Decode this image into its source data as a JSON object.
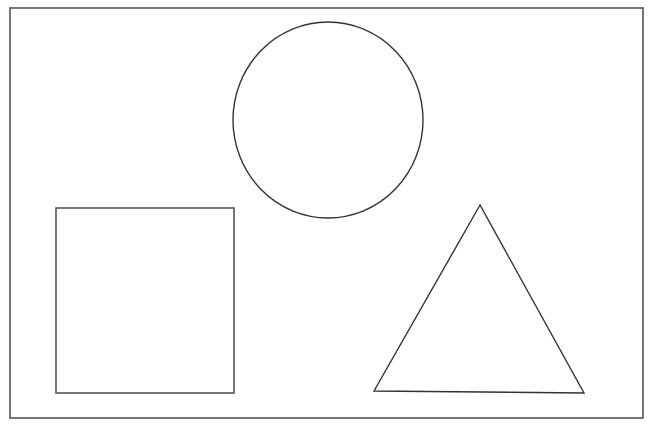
{
  "diagram": {
    "background": "#ffffff",
    "stroke_color": "#333333",
    "frame": {
      "x": 10,
      "y": 8,
      "width": 633,
      "height": 410,
      "stroke": "#555555",
      "stroke_width": 1.6
    },
    "shapes": [
      {
        "type": "circle",
        "name": "circle",
        "cx": 328,
        "cy": 120,
        "rx": 95,
        "ry": 98
      },
      {
        "type": "square",
        "name": "square",
        "x": 56,
        "y": 208,
        "width": 178,
        "height": 185
      },
      {
        "type": "triangle",
        "name": "triangle",
        "points": [
          [
            480,
            205
          ],
          [
            374,
            391
          ],
          [
            584,
            393
          ]
        ]
      }
    ]
  }
}
